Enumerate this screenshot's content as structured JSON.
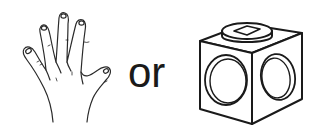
{
  "figure": {
    "left_item": {
      "label": "hand",
      "icon": "open-hand-icon"
    },
    "connector_text": "or",
    "right_item": {
      "label": "1x1 brick with studs on sides",
      "icon": "cube-brick-icon"
    }
  },
  "colors": {
    "stroke": "#1a1a1a",
    "background": "#ffffff"
  }
}
